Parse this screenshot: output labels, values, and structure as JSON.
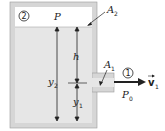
{
  "diagram": {
    "labels": {
      "pressure_top": "P",
      "area_top": "A",
      "area_top_sub": "2",
      "height_h": "h",
      "height_y2": "y",
      "height_y2_sub": "2",
      "height_y1": "y",
      "height_y1_sub": "1",
      "area_outlet": "A",
      "area_outlet_sub": "1",
      "pressure_outlet": "P",
      "pressure_outlet_sub": "0",
      "velocity": "v",
      "velocity_sub": "1",
      "point_top": "2",
      "point_outlet": "1"
    },
    "colors": {
      "wall": "#d6d6d6",
      "liquid": "#e6e6e6",
      "air": "#ffffff",
      "line": "#222222"
    }
  }
}
